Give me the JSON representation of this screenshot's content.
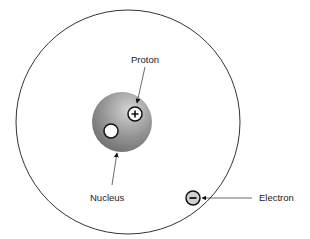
{
  "diagram": {
    "labels": {
      "proton": "Proton",
      "nucleus": "Nucleus",
      "electron": "Electron"
    },
    "symbols": {
      "proton_charge": "+",
      "electron_charge": "−"
    },
    "colors": {
      "orbit": "#333333",
      "nucleus_light": "#c8c8c8",
      "nucleus_dark": "#6e6e6e",
      "electron_fill": "#d0d0d0",
      "particle_fill": "#ffffff",
      "stroke": "#111111"
    }
  }
}
